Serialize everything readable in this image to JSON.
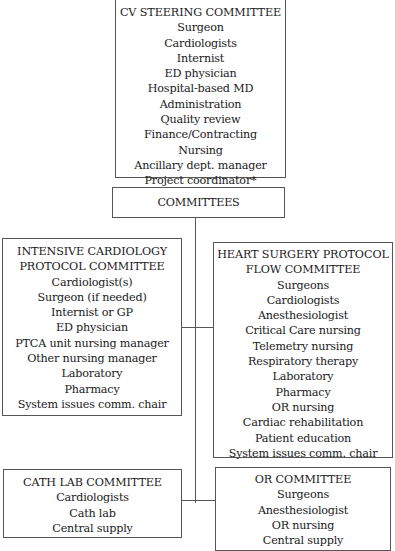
{
  "steering": {
    "title": "CV STEERING COMMITTEE",
    "members": [
      "Surgeon",
      "Cardiologists",
      "Internist",
      "ED physician",
      "Hospital-based MD",
      "Administration",
      "Quality review",
      "Finance/Contracting",
      "Nursing",
      "Ancillary dept. manager",
      "Project coordinator*",
      "Consultants*"
    ]
  },
  "committees": {
    "label": "COMMITTEES"
  },
  "intensive": {
    "title_lines": [
      "INTENSIVE CARDIOLOGY",
      "PROTOCOL COMMITTEE"
    ],
    "members": [
      "Cardiologist(s)",
      "Surgeon (if needed)",
      "Internist or GP",
      "ED physician",
      "PTCA unit nursing manager",
      "Other nursing manager",
      "Laboratory",
      "Pharmacy",
      "System issues comm. chair"
    ]
  },
  "heart": {
    "title_lines": [
      "HEART SURGERY PROTOCOL",
      "FLOW COMMITTEE"
    ],
    "members": [
      "Surgeons",
      "Cardiologists",
      "Anesthesiologist",
      "Critical Care nursing",
      "Telemetry nursing",
      "Respiratory therapy",
      "Laboratory",
      "Pharmacy",
      "OR nursing",
      "Cardiac rehabilitation",
      "Patient education",
      "System issues comm. chair"
    ]
  },
  "cath": {
    "title": "CATH LAB COMMITTEE",
    "members": [
      "Cardiologists",
      "Cath lab",
      "Central supply"
    ]
  },
  "or": {
    "title": "OR COMMITTEE",
    "members": [
      "Surgeons",
      "Anesthesiologist",
      "OR nursing",
      "Central supply"
    ]
  }
}
